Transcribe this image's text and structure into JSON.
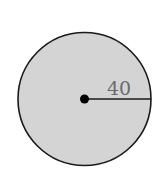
{
  "diagram": {
    "shape": "circle",
    "radius_label": "40",
    "colors": {
      "fill": "#d4d4d4",
      "stroke": "#1a1a1a",
      "label": "#6b6b6b",
      "background": "#ffffff"
    }
  }
}
